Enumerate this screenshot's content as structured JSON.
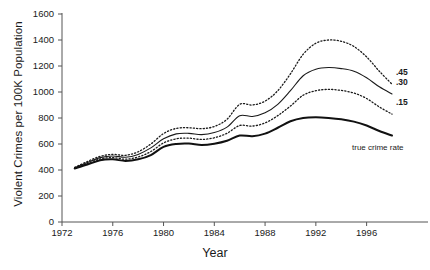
{
  "chart_data": {
    "type": "line",
    "title": "",
    "xlabel": "Year",
    "ylabel": "Violent Crimes per 100K Population",
    "xlim": [
      1972,
      1998
    ],
    "ylim": [
      0,
      1600
    ],
    "ytick_step": 200,
    "yticks": [
      0,
      200,
      400,
      600,
      800,
      1000,
      1200,
      1400,
      1600
    ],
    "xticks": [
      1972,
      1976,
      1980,
      1984,
      1988,
      1992,
      1996
    ],
    "grid": false,
    "legend_position": "right-inline",
    "x": [
      1973,
      1974,
      1975,
      1976,
      1977,
      1978,
      1979,
      1980,
      1981,
      1982,
      1983,
      1984,
      1985,
      1986,
      1987,
      1988,
      1989,
      1990,
      1991,
      1992,
      1993,
      1994,
      1995,
      1996,
      1997,
      1998
    ],
    "series": [
      {
        "name": ".45",
        "label": ".45",
        "style": "dotted",
        "width": 1.3,
        "color": "#1a1a1a",
        "values": [
          420,
          465,
          505,
          520,
          513,
          540,
          600,
          680,
          720,
          725,
          718,
          735,
          790,
          905,
          900,
          930,
          1010,
          1140,
          1290,
          1375,
          1400,
          1390,
          1350,
          1270,
          1160,
          1060
        ]
      },
      {
        "name": ".30",
        "label": ".30",
        "style": "solid",
        "width": 1.1,
        "color": "#1a1a1a",
        "values": [
          418,
          458,
          495,
          508,
          498,
          520,
          570,
          640,
          678,
          682,
          672,
          688,
          730,
          818,
          812,
          840,
          905,
          1010,
          1125,
          1175,
          1188,
          1180,
          1160,
          1110,
          1040,
          985
        ]
      },
      {
        "name": ".15",
        "label": ".15",
        "style": "dotted",
        "width": 1.3,
        "color": "#1a1a1a",
        "values": [
          415,
          450,
          485,
          495,
          483,
          500,
          542,
          608,
          640,
          645,
          635,
          648,
          682,
          742,
          738,
          762,
          818,
          892,
          975,
          1010,
          1020,
          1012,
          992,
          950,
          885,
          830
        ]
      },
      {
        "name": "true crime rate",
        "label": "true crime rate",
        "style": "solid",
        "width": 2.0,
        "color": "#111111",
        "values": [
          412,
          442,
          475,
          482,
          470,
          482,
          515,
          578,
          600,
          603,
          592,
          602,
          625,
          665,
          660,
          680,
          725,
          775,
          800,
          805,
          800,
          790,
          772,
          742,
          700,
          665
        ]
      }
    ]
  },
  "axes": {
    "y_title": "Violent Crimes per 100K Population",
    "x_title": "Year"
  }
}
